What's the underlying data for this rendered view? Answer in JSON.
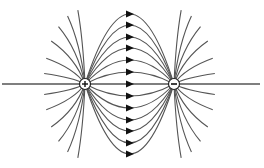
{
  "diagram": {
    "charges": [
      {
        "id": "positive",
        "sign": "+",
        "x": 85,
        "y": 84
      },
      {
        "id": "negative",
        "sign": "−",
        "x": 174,
        "y": 84
      }
    ],
    "axis": {
      "x1": 2,
      "x2": 260,
      "y": 84
    },
    "arrow_x": 130,
    "arc_offsets": [
      -70,
      -59,
      -47,
      -36,
      -24,
      -12,
      12,
      24,
      36,
      47,
      59,
      70
    ],
    "colors": {
      "line": "#555555",
      "arrow": "#111111",
      "charge_fill": "#ffffff"
    }
  }
}
